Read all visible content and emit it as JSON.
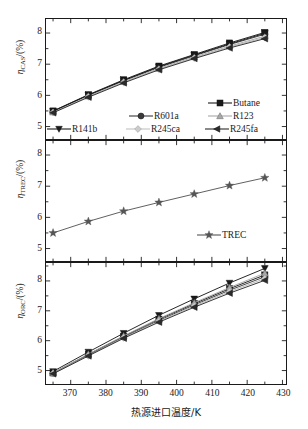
{
  "figure": {
    "xlabel": "热源进口温度/K",
    "x_tick_labels": [
      "370",
      "380",
      "390",
      "400",
      "410",
      "420",
      "430"
    ]
  },
  "panels": {
    "cas": {
      "ylabel_symbol": "η",
      "ylabel_sub": "CAS",
      "ylabel_unit": "/(%)",
      "y_tick_labels": [
        "5",
        "6",
        "7",
        "8"
      ]
    },
    "trec": {
      "ylabel_symbol": "η",
      "ylabel_sub": "TREC",
      "ylabel_unit": "/(%)",
      "y_tick_labels": [
        "5",
        "6",
        "7",
        "8"
      ]
    },
    "orc": {
      "ylabel_symbol": "η",
      "ylabel_sub": "ORC",
      "ylabel_unit": "/(%)",
      "y_tick_labels": [
        "5",
        "6",
        "7",
        "8"
      ]
    }
  },
  "legend_cas": {
    "items": [
      {
        "label": "Butane",
        "marker": "square",
        "color": "#1a1a1a"
      },
      {
        "label": "R601a",
        "marker": "circle",
        "color": "#3a3a3a"
      },
      {
        "label": "R123",
        "marker": "triangle-up",
        "color": "#a8a8a8"
      },
      {
        "label": "R141b",
        "marker": "triangle-down",
        "color": "#1a1a1a"
      },
      {
        "label": "R245ca",
        "marker": "diamond",
        "color": "#cccccc"
      },
      {
        "label": "R245fa",
        "marker": "triangle-left",
        "color": "#2b2b2b"
      }
    ]
  },
  "legend_trec": {
    "items": [
      {
        "label": "TREC",
        "marker": "star",
        "color": "#555555"
      }
    ]
  },
  "chart_data": [
    {
      "type": "line",
      "id": "cas",
      "title": "",
      "xlabel": "热源进口温度/K",
      "ylabel": "ηCAS/(%)",
      "xlim": [
        363,
        431
      ],
      "ylim": [
        4.6,
        8.45
      ],
      "x_ticks": [
        370,
        380,
        390,
        400,
        410,
        420,
        430
      ],
      "y_ticks": [
        5,
        6,
        7,
        8
      ],
      "minor_ticks": true,
      "grid": false,
      "legend_position": "lower-right-inside",
      "x": [
        365,
        375,
        385,
        395,
        405,
        415,
        425
      ],
      "series": [
        {
          "name": "Butane",
          "marker": "square",
          "color": "#1a1a1a",
          "values": [
            5.5,
            6.02,
            6.5,
            6.94,
            7.31,
            7.68,
            8.02
          ]
        },
        {
          "name": "R601a",
          "marker": "circle",
          "color": "#3a3a3a",
          "values": [
            5.48,
            6.0,
            6.47,
            6.9,
            7.27,
            7.63,
            7.96
          ]
        },
        {
          "name": "R123",
          "marker": "triangle-up",
          "color": "#a8a8a8",
          "values": [
            5.46,
            5.97,
            6.44,
            6.86,
            7.23,
            7.58,
            7.9
          ]
        },
        {
          "name": "R141b",
          "marker": "triangle-down",
          "color": "#1a1a1a",
          "values": [
            5.49,
            6.01,
            6.48,
            6.92,
            7.29,
            7.65,
            7.99
          ]
        },
        {
          "name": "R245ca",
          "marker": "diamond",
          "color": "#cccccc",
          "values": [
            5.45,
            5.96,
            6.42,
            6.84,
            7.2,
            7.55,
            7.86
          ]
        },
        {
          "name": "R245fa",
          "marker": "triangle-left",
          "color": "#2b2b2b",
          "values": [
            5.44,
            5.94,
            6.4,
            6.82,
            7.18,
            7.52,
            7.82
          ]
        }
      ]
    },
    {
      "type": "line",
      "id": "trec",
      "title": "",
      "xlabel": "热源进口温度/K",
      "ylabel": "ηTREC/(%)",
      "xlim": [
        363,
        431
      ],
      "ylim": [
        4.6,
        8.45
      ],
      "x_ticks": [
        370,
        380,
        390,
        400,
        410,
        420,
        430
      ],
      "y_ticks": [
        5,
        6,
        7,
        8
      ],
      "minor_ticks": true,
      "grid": false,
      "legend_position": "lower-right-inside",
      "x": [
        365,
        375,
        385,
        395,
        405,
        415,
        425
      ],
      "series": [
        {
          "name": "TREC",
          "marker": "star",
          "color": "#555555",
          "values": [
            5.5,
            5.87,
            6.2,
            6.48,
            6.75,
            7.02,
            7.27
          ]
        }
      ]
    },
    {
      "type": "line",
      "id": "orc",
      "title": "",
      "xlabel": "热源进口温度/K",
      "ylabel": "ηORC/(%)",
      "xlim": [
        363,
        431
      ],
      "ylim": [
        4.55,
        8.6
      ],
      "x_ticks": [
        370,
        380,
        390,
        400,
        410,
        420,
        430
      ],
      "y_ticks": [
        5,
        6,
        7,
        8
      ],
      "minor_ticks": true,
      "grid": false,
      "legend_position": "none",
      "x": [
        365,
        375,
        385,
        395,
        405,
        415,
        425
      ],
      "series": [
        {
          "name": "R141b",
          "marker": "triangle-down",
          "color": "#1a1a1a",
          "values": [
            4.97,
            5.62,
            6.25,
            6.85,
            7.4,
            7.93,
            8.42
          ]
        },
        {
          "name": "Butane",
          "marker": "square",
          "color": "#1a1a1a",
          "values": [
            4.92,
            5.54,
            6.15,
            6.72,
            7.24,
            7.74,
            8.2
          ]
        },
        {
          "name": "R601a",
          "marker": "circle",
          "color": "#3a3a3a",
          "values": [
            4.91,
            5.52,
            6.12,
            6.68,
            7.2,
            7.69,
            8.14
          ]
        },
        {
          "name": "R123",
          "marker": "triangle-up",
          "color": "#a8a8a8",
          "values": [
            4.93,
            5.55,
            6.16,
            6.74,
            7.27,
            7.78,
            8.26
          ]
        },
        {
          "name": "R245ca",
          "marker": "diamond",
          "color": "#cccccc",
          "values": [
            4.9,
            5.5,
            6.1,
            6.65,
            7.16,
            7.64,
            8.08
          ]
        },
        {
          "name": "R245fa",
          "marker": "triangle-left",
          "color": "#2b2b2b",
          "values": [
            4.89,
            5.49,
            6.08,
            6.62,
            7.12,
            7.59,
            8.02
          ]
        }
      ]
    }
  ]
}
